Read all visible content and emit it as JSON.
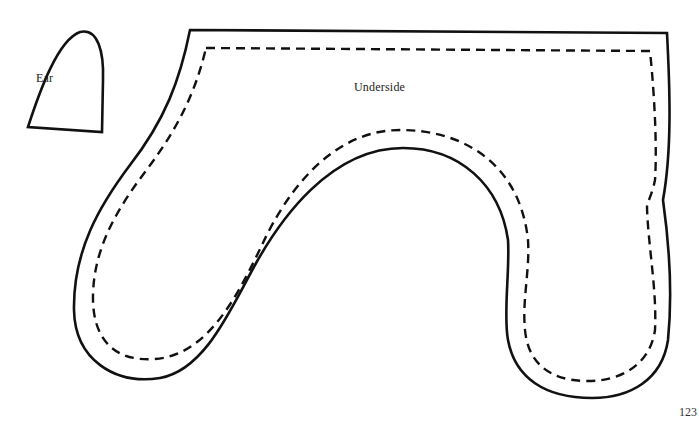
{
  "pattern": {
    "pieces": [
      {
        "id": "ear",
        "label": "Ear"
      },
      {
        "id": "underside",
        "label": "Underside"
      }
    ],
    "line_styles": {
      "cut_line": "solid",
      "stitch_line": "dashed"
    },
    "stroke_color": "#111111"
  },
  "page": {
    "number": "123"
  }
}
